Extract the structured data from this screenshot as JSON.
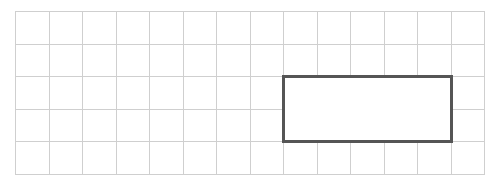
{
  "diagram": {
    "type": "grid-with-rectangle",
    "grid": {
      "columns": 14,
      "rows": 5,
      "cell_width": 33.5,
      "cell_height": 32.6,
      "line_color": "#cfcfcf"
    },
    "rectangle": {
      "col_start": 8,
      "row_start": 2,
      "width_cells": 5,
      "height_cells": 2,
      "border_color": "#555555",
      "border_width": 3
    }
  }
}
